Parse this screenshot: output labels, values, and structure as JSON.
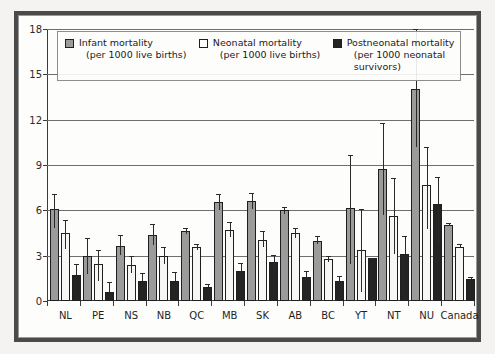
{
  "figure": {
    "frame_color": "#4a4a4a",
    "background": "#f4f3f1",
    "plot_background": "#fdfdfc"
  },
  "legend": {
    "position": "top-inside",
    "entries": [
      {
        "key": "infant",
        "label": "Infant mortality",
        "sub": "(per 1000 live births)",
        "color": "#9b9b9b"
      },
      {
        "key": "neonatal",
        "label": "Neonatal mortality",
        "sub": "(per 1000 live births)",
        "color": "#ffffff"
      },
      {
        "key": "post",
        "label": "Postneonatal mortality",
        "sub": "(per 1000 neonatal survivors)",
        "color": "#242424"
      }
    ]
  },
  "chart_data": {
    "type": "bar",
    "title": "",
    "subtitle": "",
    "xlabel": "",
    "ylabel": "",
    "ylim": [
      0,
      18
    ],
    "yticks": [
      0,
      3,
      6,
      9,
      12,
      15,
      18
    ],
    "ytick_labels": [
      "0",
      "3",
      "6",
      "9",
      "12",
      "15",
      "18"
    ],
    "grid": true,
    "grid_axis": "y",
    "legend_position": "upper-left-inside",
    "error_bars": "95% confidence interval",
    "categories": [
      "NL",
      "PE",
      "NS",
      "NB",
      "QC",
      "MB",
      "SK",
      "AB",
      "BC",
      "YT",
      "NT",
      "NU",
      "Canada"
    ],
    "series": [
      {
        "name": "Infant mortality (per 1000 live births)",
        "color": "#9b9b9b",
        "values": [
          6.1,
          3.0,
          3.65,
          4.35,
          4.65,
          6.55,
          6.6,
          6.0,
          4.0,
          6.15,
          8.75,
          14.0,
          5.05
        ],
        "err_low": [
          4.8,
          1.8,
          3.05,
          3.7,
          4.45,
          6.0,
          6.1,
          5.75,
          3.75,
          2.45,
          5.7,
          10.2,
          4.95
        ],
        "err_high": [
          7.1,
          4.15,
          4.4,
          5.1,
          4.85,
          7.1,
          7.15,
          6.25,
          4.3,
          9.65,
          11.75,
          18.0,
          5.15
        ]
      },
      {
        "name": "Neonatal mortality (per 1000 live births)",
        "color": "#ffffff",
        "values": [
          4.5,
          2.45,
          2.4,
          3.0,
          3.6,
          4.7,
          4.05,
          4.5,
          2.75,
          3.35,
          5.65,
          7.65,
          3.6
        ],
        "err_low": [
          3.45,
          1.35,
          1.85,
          2.45,
          3.4,
          4.25,
          3.6,
          4.2,
          2.55,
          0.6,
          3.1,
          4.75,
          3.5
        ],
        "err_high": [
          5.35,
          3.4,
          3.0,
          3.55,
          3.8,
          5.2,
          4.6,
          4.85,
          3.0,
          6.1,
          8.15,
          10.2,
          3.75
        ]
      },
      {
        "name": "Postneonatal mortality (per 1000 neonatal survivors)",
        "color": "#242424",
        "values": [
          1.7,
          0.6,
          1.3,
          1.35,
          0.95,
          2.0,
          2.6,
          1.6,
          1.3,
          2.85,
          3.1,
          6.45,
          1.45
        ],
        "err_low": [
          1.7,
          0.6,
          1.3,
          1.35,
          0.95,
          2.0,
          2.15,
          1.6,
          1.3,
          2.85,
          3.1,
          3.85,
          1.45
        ],
        "err_high": [
          2.45,
          1.25,
          1.85,
          1.9,
          1.1,
          2.5,
          3.05,
          2.0,
          1.65,
          2.85,
          4.3,
          8.2,
          1.6
        ]
      }
    ]
  }
}
